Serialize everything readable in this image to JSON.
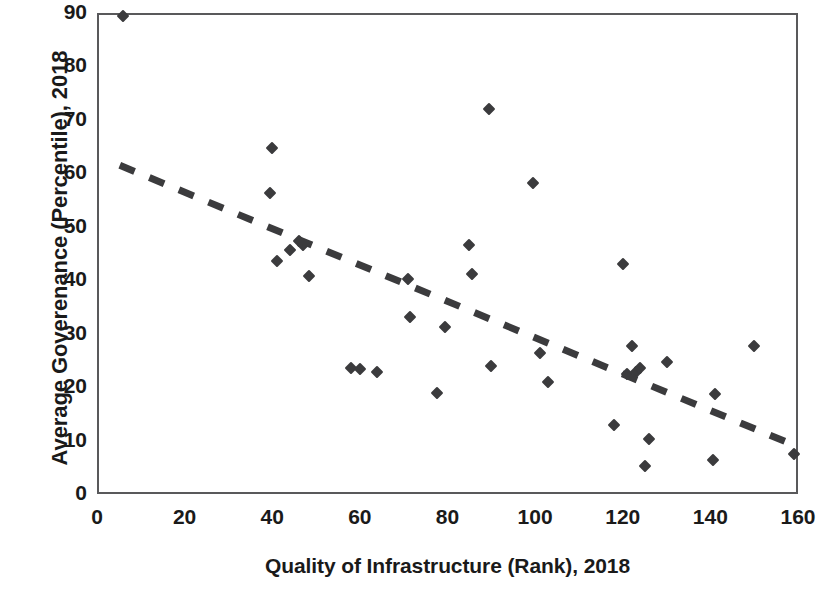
{
  "chart_data": {
    "type": "scatter",
    "title": "",
    "xlabel": "Quality of Infrastructure (Rank), 2018",
    "ylabel": "Average Goverenance (Percentile), 2018",
    "xlim": [
      0,
      160
    ],
    "ylim": [
      0,
      90
    ],
    "xticks": [
      0,
      20,
      40,
      60,
      80,
      100,
      120,
      140,
      160
    ],
    "yticks": [
      0,
      10,
      20,
      30,
      40,
      50,
      60,
      70,
      80,
      90
    ],
    "xtick_labels": [
      "0",
      "20",
      "40",
      "60",
      "80",
      "100",
      "120",
      "140",
      "160"
    ],
    "ytick_labels": [
      "0",
      "10",
      "20",
      "30",
      "40",
      "50",
      "60",
      "70",
      "80",
      "90"
    ],
    "grid": false,
    "legend": null,
    "marker_shape": "diamond",
    "marker_color": "#3b3b3d",
    "points": [
      {
        "x": 6,
        "y": 89.5
      },
      {
        "x": 40,
        "y": 64.7
      },
      {
        "x": 39.5,
        "y": 56.3
      },
      {
        "x": 41,
        "y": 43.6
      },
      {
        "x": 44,
        "y": 45.6
      },
      {
        "x": 46,
        "y": 47.3
      },
      {
        "x": 47,
        "y": 46.5
      },
      {
        "x": 48.5,
        "y": 40.8
      },
      {
        "x": 58,
        "y": 23.5
      },
      {
        "x": 60,
        "y": 23.4
      },
      {
        "x": 64,
        "y": 22.9
      },
      {
        "x": 71,
        "y": 40.3
      },
      {
        "x": 71.5,
        "y": 33.2
      },
      {
        "x": 77.5,
        "y": 18.9
      },
      {
        "x": 79.5,
        "y": 31.2
      },
      {
        "x": 85,
        "y": 46.5
      },
      {
        "x": 85.5,
        "y": 41.2
      },
      {
        "x": 89.5,
        "y": 72.0
      },
      {
        "x": 90,
        "y": 23.9
      },
      {
        "x": 99.5,
        "y": 58.2
      },
      {
        "x": 101,
        "y": 26.4
      },
      {
        "x": 103,
        "y": 20.9
      },
      {
        "x": 118,
        "y": 12.9
      },
      {
        "x": 120,
        "y": 43.0
      },
      {
        "x": 121,
        "y": 22.4
      },
      {
        "x": 122,
        "y": 27.6
      },
      {
        "x": 123,
        "y": 22.9
      },
      {
        "x": 124,
        "y": 23.5
      },
      {
        "x": 125,
        "y": 5.2
      },
      {
        "x": 126,
        "y": 10.2
      },
      {
        "x": 130,
        "y": 24.7
      },
      {
        "x": 140.5,
        "y": 6.3
      },
      {
        "x": 141,
        "y": 18.8
      },
      {
        "x": 150,
        "y": 27.7
      },
      {
        "x": 159,
        "y": 7.5
      }
    ],
    "trendline": {
      "style": "dashed",
      "color": "#3b3b3d",
      "width": 7,
      "x0": 5.2,
      "y0": 61.5,
      "x1": 159.5,
      "y1": 9.0
    }
  },
  "axes": {
    "y_title": "Average Goverenance (Percentile), 2018",
    "x_title": "Quality of Infrastructure (Rank), 2018"
  }
}
